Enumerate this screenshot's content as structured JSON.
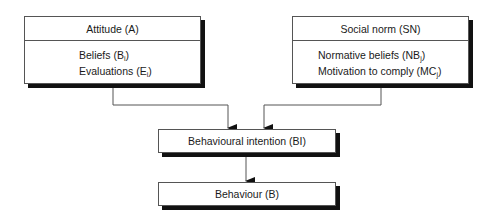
{
  "diagram": {
    "attitude": {
      "title": "Attitude (A)",
      "items": [
        {
          "label": "Beliefs (B",
          "sub": "i",
          "close": ")"
        },
        {
          "label": "Evaluations (E",
          "sub": "i",
          "close": ")"
        }
      ]
    },
    "social_norm": {
      "title": "Social norm (SN)",
      "items": [
        {
          "label": "Normative beliefs (NB",
          "sub": "j",
          "close": ")"
        },
        {
          "label": "Motivation to comply (MC",
          "sub": "j",
          "close": ")"
        }
      ]
    },
    "intention": {
      "title": "Behavioural intention (BI)"
    },
    "behaviour": {
      "title": "Behaviour (B)"
    },
    "edges": [
      {
        "from": "Attitude (A)",
        "to": "Behavioural intention (BI)"
      },
      {
        "from": "Social norm (SN)",
        "to": "Behavioural intention (BI)"
      },
      {
        "from": "Behavioural intention (BI)",
        "to": "Behaviour (B)"
      }
    ],
    "colors": {
      "line": "#555555",
      "shadow": "#111111",
      "background": "#ffffff"
    }
  }
}
